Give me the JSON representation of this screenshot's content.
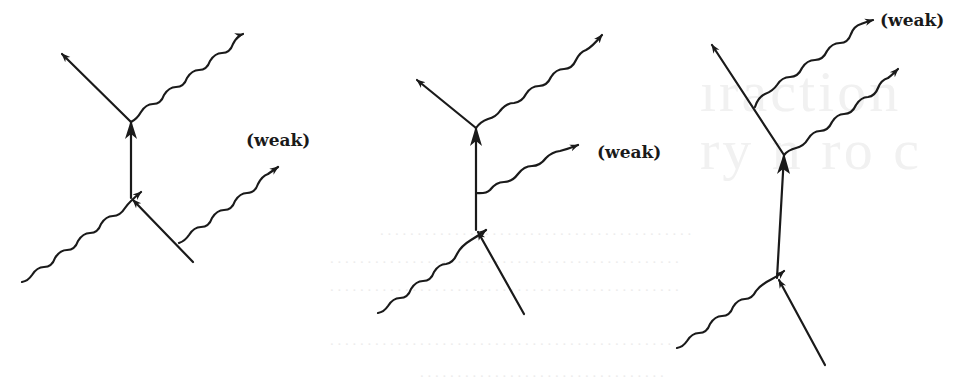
{
  "figure": {
    "colors": {
      "background": "#ffffff",
      "ink": "#1a1a1a",
      "bleed_through": "#efefef"
    },
    "diagrams": [
      {
        "id": "diagram-1",
        "label": "(weak)",
        "weak_photon_source": "incoming electron line",
        "vertices": {
          "upper": [
            131,
            122
          ],
          "lower": [
            131,
            198
          ]
        },
        "label_position": [
          276,
          140
        ]
      },
      {
        "id": "diagram-2",
        "label": "(weak)",
        "weak_photon_source": "internal electron propagator",
        "vertices": {
          "upper": [
            476,
            128
          ],
          "lower": [
            476,
            230
          ]
        },
        "label_position": [
          597,
          158
        ]
      },
      {
        "id": "diagram-3",
        "label": "(weak)",
        "weak_photon_source": "outgoing electron line",
        "vertices": {
          "upper": [
            784,
            155
          ],
          "lower": [
            777,
            278
          ]
        },
        "label_position": [
          880,
          24
        ]
      }
    ]
  }
}
